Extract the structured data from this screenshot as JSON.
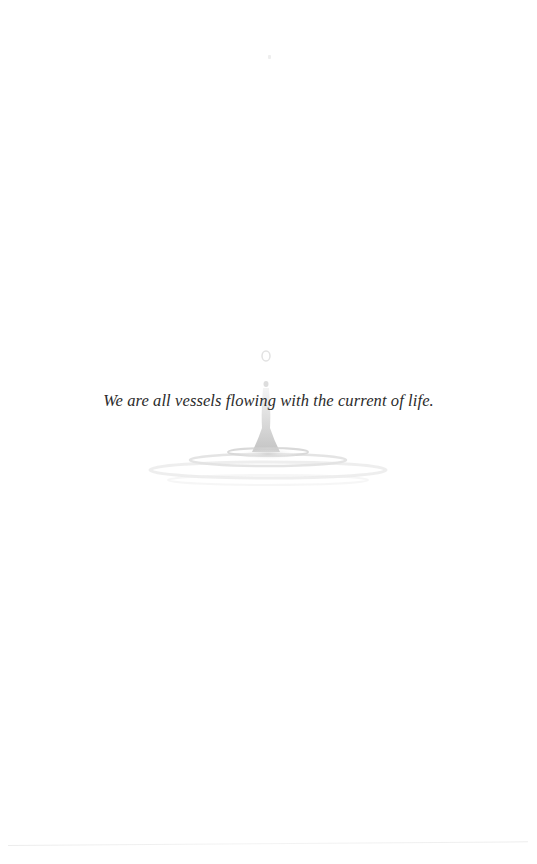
{
  "page": {
    "quote": "We are all vessels flowing with the current of life.",
    "illustration": "water-droplet-splash-ripples",
    "colors": {
      "background": "#ffffff",
      "text": "#2b2b2b",
      "droplet": "#c8c8c8",
      "ripple": "#d6d6d6"
    }
  }
}
